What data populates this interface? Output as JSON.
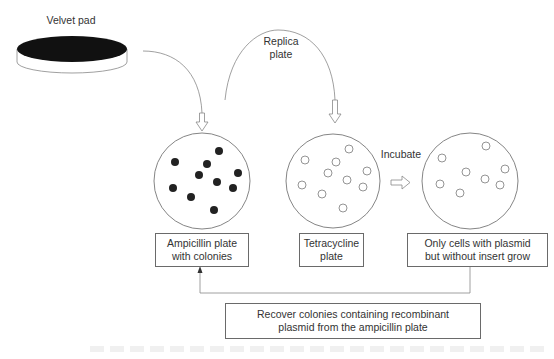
{
  "diagram": {
    "velvet_pad": {
      "label": "Velvet pad"
    },
    "replica_step": {
      "label_line1": "Replica",
      "label_line2": "plate"
    },
    "incubate_step": {
      "label": "Incubate"
    },
    "plates": [
      {
        "id": "ampicillin",
        "colony_style": "filled",
        "colony_count": 10,
        "box_line1": "Ampicillin plate",
        "box_line2": "with colonies"
      },
      {
        "id": "tetracycline",
        "colony_style": "hollow",
        "colony_count": 10,
        "box_line1": "Tetracycline",
        "box_line2": "plate"
      },
      {
        "id": "result",
        "colony_style": "hollow",
        "colony_count": 8,
        "box_line1": "Only cells with plasmid",
        "box_line2": "but without insert grow"
      }
    ],
    "recover_box": {
      "line1": "Recover colonies containing recombinant",
      "line2": "plasmid from the ampicillin plate"
    },
    "colors": {
      "line": "#777777",
      "colony_filled": "#222222",
      "pad": "#111111"
    }
  }
}
